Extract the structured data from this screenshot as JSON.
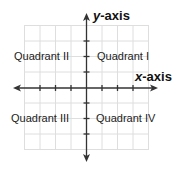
{
  "diagram": {
    "type": "coordinate-plane",
    "y_axis_label": {
      "var": "y",
      "suffix": "-axis"
    },
    "x_axis_label": {
      "var": "x",
      "suffix": "-axis"
    },
    "quadrants": {
      "q1": "Quadrant I",
      "q2": "Quadrant II",
      "q3": "Quadrant III",
      "q4": "Quadrant IV"
    },
    "grid_color": "#dcdcdc",
    "axis_color": "#333333"
  }
}
